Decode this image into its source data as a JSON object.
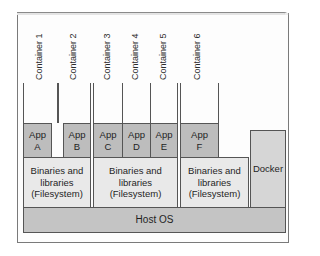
{
  "diagram": {
    "type": "architecture-stack",
    "containers": [
      {
        "label": "Container 1",
        "app": "App\nA",
        "binaries_group": 0
      },
      {
        "label": "Container 2",
        "app": "App\nB",
        "binaries_group": 0
      },
      {
        "label": "Container 3",
        "app": "App\nC",
        "binaries_group": 1
      },
      {
        "label": "Container 4",
        "app": "App\nD",
        "binaries_group": 1
      },
      {
        "label": "Container 5",
        "app": "App\nE",
        "binaries_group": 1
      },
      {
        "label": "Container 6",
        "app": "App\nF",
        "binaries_group": 2
      }
    ],
    "binaries": [
      {
        "label": "Binaries and\nlibraries\n(Filesystem)"
      },
      {
        "label": "Binaries and\nlibraries\n(Filesystem)"
      },
      {
        "label": "Binaries and\nlibraries\n(Filesystem)"
      }
    ],
    "docker": {
      "label": "Docker"
    },
    "host": {
      "label": "Host OS"
    },
    "colors": {
      "app_fill": "#bdbdbd",
      "binaries_fill": "#e9e9e9",
      "docker_fill": "#d6d6d6",
      "host_fill": "#c4c4c4",
      "stroke": "#555555"
    }
  }
}
